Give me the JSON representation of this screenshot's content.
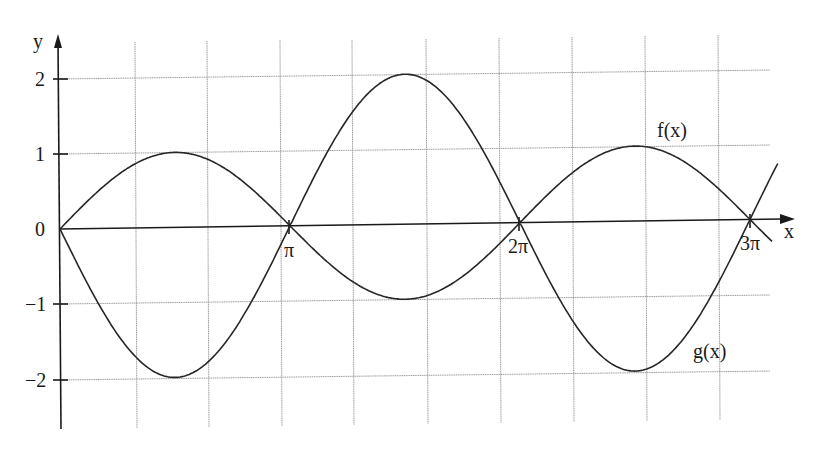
{
  "chart_data": {
    "type": "line",
    "title": "",
    "xlabel": "x",
    "ylabel": "y",
    "xlim": [
      0,
      9.9
    ],
    "ylim": [
      -2.6,
      2.4
    ],
    "grid": true,
    "x_tick_labels": [
      "π",
      "2π",
      "3π"
    ],
    "x_ticks": [
      3.1416,
      6.2832,
      9.4248
    ],
    "y_tick_labels": [
      "2",
      "1",
      "0",
      "−1",
      "−2"
    ],
    "y_ticks": [
      2,
      1,
      0,
      -1,
      -2
    ],
    "series": [
      {
        "name": "f(x)",
        "description": "sin x on [0,π] (max 1), −2 sin x on [π,2π] (max 2), sin x on [2π,3π] (max 1), continuing below axis after 3π",
        "x": [
          0,
          0.785,
          1.571,
          2.356,
          3.142,
          3.927,
          4.712,
          5.498,
          6.283,
          7.069,
          7.854,
          8.639,
          9.425,
          9.8
        ],
        "y": [
          0,
          0.71,
          1.0,
          0.71,
          0,
          1.41,
          2.0,
          1.41,
          0,
          0.71,
          1.0,
          0.71,
          0,
          -0.37
        ]
      },
      {
        "name": "g(x)",
        "description": "−2 sin x on [0,π] (min −2), sin x on [π,2π] (min −1), −2 sin x on [2π,3π] (min −2), continuing above axis after 3π",
        "x": [
          0,
          0.785,
          1.571,
          2.356,
          3.142,
          3.927,
          4.712,
          5.498,
          6.283,
          7.069,
          7.854,
          8.639,
          9.425,
          9.8
        ],
        "y": [
          0,
          -1.41,
          -2.0,
          -1.41,
          0,
          -0.71,
          -1.0,
          -0.71,
          0,
          -1.41,
          -2.0,
          -1.41,
          0,
          0.73
        ]
      }
    ],
    "annotations": [
      "f(x)",
      "g(x)"
    ],
    "legend": "none (curves labeled inline)"
  },
  "labels": {
    "y_axis": "y",
    "x_axis": "x",
    "origin": "0",
    "y_2": "2",
    "y_1": "1",
    "y_m1": "−1",
    "y_m2": "−2",
    "x_pi": "π",
    "x_2pi": "2π",
    "x_3pi": "3π",
    "f_label": "f(x)",
    "g_label": "g(x)"
  }
}
